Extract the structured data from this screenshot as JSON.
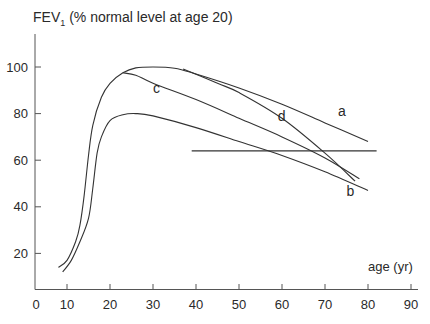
{
  "chart_data": {
    "type": "line",
    "title": "FEV1 (% normal level at age 20)",
    "ylabel_main": "FEV",
    "ylabel_sub": "1",
    "ylabel_rest": " (% normal level at age 20)",
    "xlabel": "age (yr)",
    "xlim": [
      0,
      90
    ],
    "ylim": [
      5,
      110
    ],
    "xticks": [
      0,
      10,
      20,
      30,
      40,
      50,
      60,
      70,
      80,
      90
    ],
    "yticks": [
      20,
      40,
      60,
      80,
      100
    ],
    "grid": false,
    "series": [
      {
        "name": "a",
        "label_pos": [
          73,
          79
        ],
        "points": [
          [
            8,
            14
          ],
          [
            10,
            17
          ],
          [
            12,
            25
          ],
          [
            13,
            32
          ],
          [
            14,
            45
          ],
          [
            15,
            62
          ],
          [
            16,
            75
          ],
          [
            18,
            87
          ],
          [
            20,
            93
          ],
          [
            23,
            97.5
          ],
          [
            26,
            99.6
          ],
          [
            30,
            100
          ],
          [
            35,
            99.5
          ],
          [
            40,
            97
          ],
          [
            50,
            91
          ],
          [
            60,
            84
          ],
          [
            70,
            76
          ],
          [
            80,
            68
          ]
        ]
      },
      {
        "name": "c",
        "label_pos": [
          30,
          89
        ],
        "points": [
          [
            23,
            97.5
          ],
          [
            26,
            96.5
          ],
          [
            30,
            93
          ],
          [
            40,
            86
          ],
          [
            50,
            78
          ],
          [
            60,
            70
          ],
          [
            70,
            61
          ],
          [
            78,
            52
          ]
        ]
      },
      {
        "name": "d",
        "label_pos": [
          59,
          77
        ],
        "points": [
          [
            37,
            99.2
          ],
          [
            45,
            93
          ],
          [
            50,
            89
          ],
          [
            60,
            78
          ],
          [
            70,
            63
          ],
          [
            77,
            51
          ]
        ]
      },
      {
        "name": "b",
        "label_pos": [
          75,
          44.5
        ],
        "points": [
          [
            9,
            12
          ],
          [
            11,
            17
          ],
          [
            13,
            25
          ],
          [
            15,
            35
          ],
          [
            16,
            48
          ],
          [
            17,
            63
          ],
          [
            18,
            70
          ],
          [
            20,
            77
          ],
          [
            23,
            79.5
          ],
          [
            26,
            80
          ],
          [
            30,
            79
          ],
          [
            40,
            74
          ],
          [
            50,
            68
          ],
          [
            60,
            62
          ],
          [
            70,
            55
          ],
          [
            80,
            47
          ]
        ]
      }
    ],
    "reference_line": {
      "value": 64,
      "x_from": 39,
      "x_to": 82
    }
  }
}
